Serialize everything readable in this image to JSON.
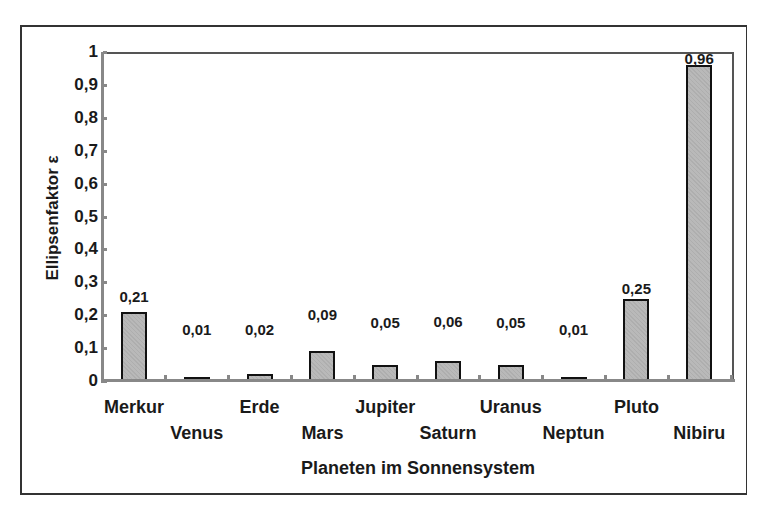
{
  "chart_data": {
    "type": "bar",
    "title": "",
    "xlabel": "Planeten im Sonnensystem",
    "ylabel": "Ellipsenfaktor ε",
    "ylim": [
      0,
      1
    ],
    "yticks": [
      "0",
      "0,1",
      "0,2",
      "0,3",
      "0,4",
      "0,5",
      "0,6",
      "0,7",
      "0,8",
      "0,9",
      "1"
    ],
    "categories": [
      "Merkur",
      "Venus",
      "Erde",
      "Mars",
      "Jupiter",
      "Saturn",
      "Uranus",
      "Neptun",
      "Pluto",
      "Nibiru"
    ],
    "values": [
      0.21,
      0.01,
      0.02,
      0.09,
      0.05,
      0.06,
      0.05,
      0.01,
      0.25,
      0.96
    ],
    "value_labels": [
      "0,21",
      "0,01",
      "0,02",
      "0,09",
      "0,05",
      "0,06",
      "0,05",
      "0,01",
      "0,25",
      "0,96"
    ],
    "grid": false,
    "legend": null,
    "bar_color": "#b9b9b9"
  }
}
